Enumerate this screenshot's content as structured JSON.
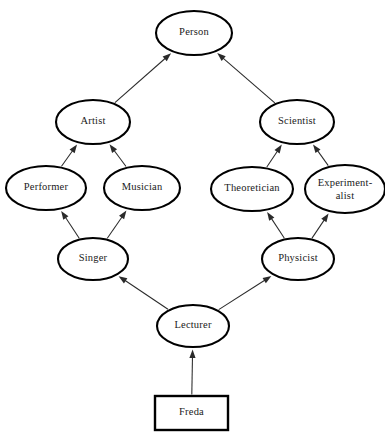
{
  "diagram": {
    "type": "inheritance-lattice",
    "canvas": {
      "width": 385,
      "height": 440,
      "background": "#ffffff"
    },
    "style": {
      "node_fill": "#ffffff",
      "node_stroke": "#000000",
      "edge_color": "#2a2a2a",
      "text_color": "#1a1a1a"
    },
    "nodes": [
      {
        "id": "person",
        "label": "Person",
        "shape": "ellipse",
        "cx": 194,
        "cy": 33,
        "rx": 38,
        "ry": 22
      },
      {
        "id": "artist",
        "label": "Artist",
        "shape": "ellipse",
        "cx": 93,
        "cy": 122,
        "rx": 37,
        "ry": 22
      },
      {
        "id": "scientist",
        "label": "Scientist",
        "shape": "ellipse",
        "cx": 297,
        "cy": 122,
        "rx": 37,
        "ry": 22
      },
      {
        "id": "performer",
        "label": "Performer",
        "shape": "ellipse",
        "cx": 46,
        "cy": 188,
        "rx": 40,
        "ry": 22
      },
      {
        "id": "musician",
        "label": "Musician",
        "shape": "ellipse",
        "cx": 142,
        "cy": 188,
        "rx": 38,
        "ry": 22
      },
      {
        "id": "theoretician",
        "label": "Theoretician",
        "shape": "ellipse",
        "cx": 252,
        "cy": 189,
        "rx": 41,
        "ry": 22
      },
      {
        "id": "experimentalist",
        "label": "Experiment-",
        "label2": "alist",
        "shape": "ellipse",
        "cx": 345,
        "cy": 189,
        "rx": 40,
        "ry": 24
      },
      {
        "id": "singer",
        "label": "Singer",
        "shape": "ellipse",
        "cx": 93,
        "cy": 259,
        "rx": 35,
        "ry": 21
      },
      {
        "id": "physicist",
        "label": "Physicist",
        "shape": "ellipse",
        "cx": 298,
        "cy": 259,
        "rx": 36,
        "ry": 21
      },
      {
        "id": "lecturer",
        "label": "Lecturer",
        "shape": "ellipse",
        "cx": 193,
        "cy": 326,
        "rx": 36,
        "ry": 21
      },
      {
        "id": "freda",
        "label": "Freda",
        "shape": "rectangle",
        "x": 155,
        "y": 396,
        "width": 73,
        "height": 34
      }
    ],
    "edges": [
      {
        "from": "artist",
        "to": "person",
        "relation": "is-a"
      },
      {
        "from": "scientist",
        "to": "person",
        "relation": "is-a"
      },
      {
        "from": "performer",
        "to": "artist",
        "relation": "is-a"
      },
      {
        "from": "musician",
        "to": "artist",
        "relation": "is-a"
      },
      {
        "from": "theoretician",
        "to": "scientist",
        "relation": "is-a"
      },
      {
        "from": "experimentalist",
        "to": "scientist",
        "relation": "is-a"
      },
      {
        "from": "singer",
        "to": "performer",
        "relation": "is-a"
      },
      {
        "from": "singer",
        "to": "musician",
        "relation": "is-a"
      },
      {
        "from": "physicist",
        "to": "theoretician",
        "relation": "is-a"
      },
      {
        "from": "physicist",
        "to": "experimentalist",
        "relation": "is-a"
      },
      {
        "from": "lecturer",
        "to": "singer",
        "relation": "is-a"
      },
      {
        "from": "lecturer",
        "to": "physicist",
        "relation": "is-a"
      },
      {
        "from": "freda",
        "to": "lecturer",
        "relation": "instance-of"
      }
    ]
  }
}
